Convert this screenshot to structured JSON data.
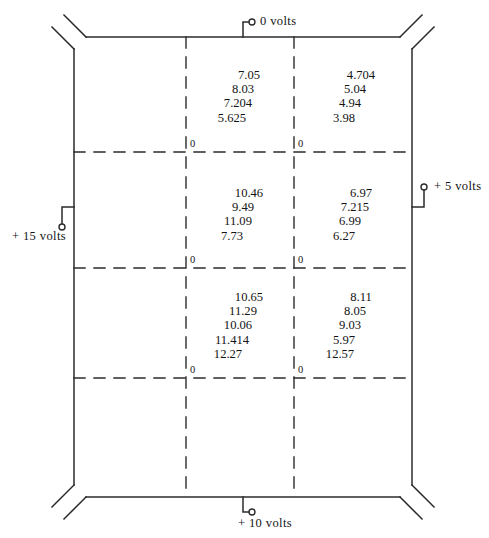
{
  "diagram": {
    "terminals": [
      {
        "name": "top-terminal",
        "label": "0 volts",
        "position": "top"
      },
      {
        "name": "right-terminal",
        "label": "+ 5 volts",
        "position": "right"
      },
      {
        "name": "left-terminal",
        "label": "+ 15 volts",
        "position": "left"
      },
      {
        "name": "bottom-terminal",
        "label": "+ 10 volts",
        "position": "bottom"
      }
    ],
    "zero_marker": "0",
    "cells": [
      {
        "name": "cell-top-left",
        "row": 0,
        "col": 0,
        "values": [
          "7.05",
          "8.03",
          "7.204",
          "5.625"
        ]
      },
      {
        "name": "cell-top-right",
        "row": 0,
        "col": 1,
        "values": [
          "4.704",
          "5.04",
          "4.94",
          "3.98"
        ]
      },
      {
        "name": "cell-middle-left",
        "row": 1,
        "col": 0,
        "values": [
          "10.46",
          "9.49",
          "11.09",
          "7.73"
        ]
      },
      {
        "name": "cell-middle-right",
        "row": 1,
        "col": 1,
        "values": [
          "6.97",
          "7.215",
          "6.99",
          "6.27"
        ]
      },
      {
        "name": "cell-bottom-left",
        "row": 2,
        "col": 0,
        "values": [
          "10.65",
          "11.29",
          "10.06",
          "11.414",
          "12.27"
        ]
      },
      {
        "name": "cell-bottom-right",
        "row": 2,
        "col": 1,
        "values": [
          "8.11",
          "8.05",
          "9.03",
          "5.97",
          "12.57"
        ]
      }
    ],
    "colors": {
      "line": "#2b2b2b",
      "text": "#131313",
      "background": "#ffffff"
    }
  }
}
